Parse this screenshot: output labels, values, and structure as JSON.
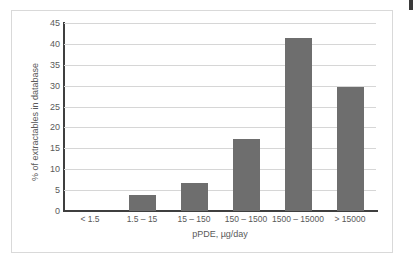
{
  "chart_data": {
    "type": "bar",
    "title": "",
    "xlabel": "pPDE, µg/day",
    "ylabel": "% of extractables in database",
    "categories": [
      "< 1.5",
      "1.5 – 15",
      "15 – 150",
      "150 – 1500",
      "1500 – 15000",
      "> 15000"
    ],
    "values": [
      0,
      3.8,
      6.7,
      17.3,
      41.5,
      29.7
    ],
    "ylim": [
      0,
      45
    ],
    "ytick_values": [
      0,
      5,
      10,
      15,
      20,
      25,
      30,
      35,
      40,
      45
    ],
    "ytick_labels": [
      "0",
      "5",
      "10",
      "15",
      "20",
      "25",
      "30",
      "35",
      "40",
      "45"
    ],
    "grid": true,
    "legend": "none",
    "bar_color": "#6e6e6e",
    "gridline_color": "#d6d6d6",
    "axis_color": "#3f3f3f",
    "background_color": "#ffffff",
    "frame_color": "#d9d9d9"
  }
}
